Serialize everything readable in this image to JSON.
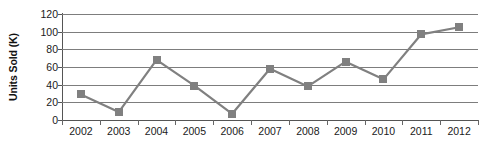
{
  "chart_data": {
    "type": "line",
    "title": "",
    "subtitle": "",
    "xlabel": "",
    "ylabel": "Units Sold (K)",
    "categories": [
      "2002",
      "2003",
      "2004",
      "2005",
      "2006",
      "2007",
      "2008",
      "2009",
      "2010",
      "2011",
      "2012"
    ],
    "values": [
      29,
      9,
      68,
      39,
      7,
      58,
      38,
      66,
      46,
      97,
      105
    ],
    "series": [
      {
        "name": "Units Sold",
        "values": [
          29,
          9,
          68,
          39,
          7,
          58,
          38,
          66,
          46,
          97,
          105
        ]
      }
    ],
    "ylim": [
      0,
      120
    ],
    "ytick_values": [
      0,
      20,
      40,
      60,
      80,
      100,
      120
    ],
    "ytick_labels": [
      "0",
      "20",
      "40",
      "60",
      "80",
      "100",
      "120"
    ],
    "xtick_labels": [
      "2002",
      "2003",
      "2004",
      "2005",
      "2006",
      "2007",
      "2008",
      "2009",
      "2010",
      "2011",
      "2012"
    ],
    "grid": true,
    "grid_axis": "y",
    "legend": false,
    "legend_position": "none",
    "marker": "square",
    "annotations": [],
    "colors": {
      "series_line": "#808080",
      "marker_fill": "#808080",
      "gridline": "#7d7d7d",
      "axis": "#555555",
      "text": "#1a1a1a",
      "background": "#ffffff"
    }
  }
}
